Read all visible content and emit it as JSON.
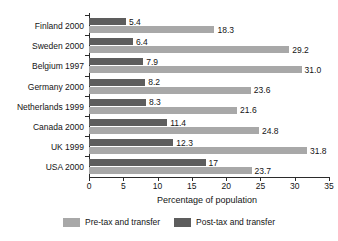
{
  "chart_data": {
    "type": "bar",
    "orientation": "horizontal",
    "title": "",
    "xlabel": "Percentage of population",
    "ylabel": "",
    "xlim": [
      0,
      35
    ],
    "xticks": [
      0,
      5,
      10,
      15,
      20,
      25,
      30,
      35
    ],
    "grid": false,
    "legend_position": "bottom-center",
    "categories": [
      "Finland 2000",
      "Sweden 2000",
      "Belgium 1997",
      "Germany 2000",
      "Netherlands 1999",
      "Canada 2000",
      "UK 1999",
      "USA 2000"
    ],
    "series": [
      {
        "name": "Post-tax and transfer",
        "color": "#5d5d5d",
        "values": [
          5.4,
          6.4,
          7.9,
          8.2,
          8.3,
          11.4,
          12.3,
          17
        ],
        "labels": [
          "5.4",
          "6.4",
          "7.9",
          "8.2",
          "8.3",
          "11.4",
          "12.3",
          "17"
        ]
      },
      {
        "name": "Pre-tax and transfer",
        "color": "#a8a8a8",
        "values": [
          18.3,
          29.2,
          31.0,
          23.6,
          21.6,
          24.8,
          31.8,
          23.7
        ],
        "labels": [
          "18.3",
          "29.2",
          "31.0",
          "23.6",
          "21.6",
          "24.8",
          "31.8",
          "23.7"
        ]
      }
    ]
  },
  "legend": {
    "items": [
      {
        "label": "Pre-tax and transfer",
        "color": "#a8a8a8"
      },
      {
        "label": "Post-tax and transfer",
        "color": "#5d5d5d"
      }
    ]
  }
}
